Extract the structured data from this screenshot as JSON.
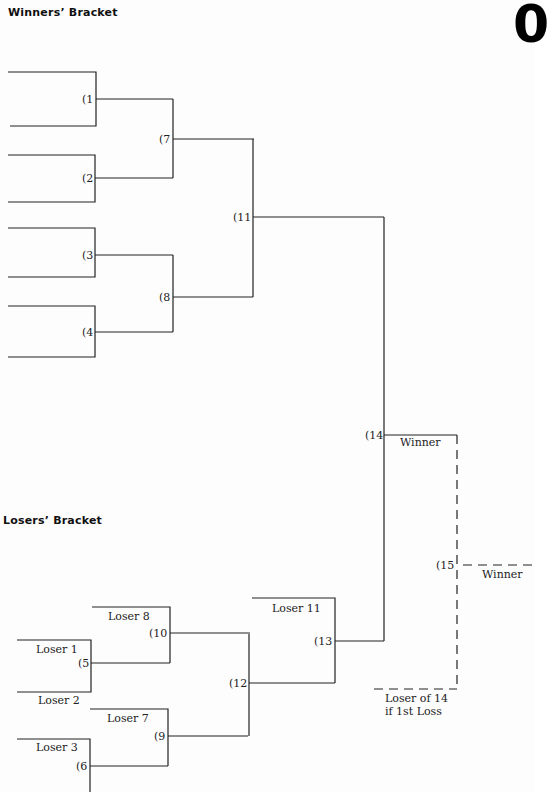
{
  "headings": {
    "winners": "Winners’ Bracket",
    "losers": "Losers’ Bracket",
    "corner_mark": "0"
  },
  "winners_bracket": {
    "games": {
      "g1": "(1",
      "g2": "(2",
      "g3": "(3",
      "g4": "(4",
      "g7": "(7",
      "g8": "(8",
      "g11": "(11",
      "g14": "(14"
    },
    "winner_label": "Winner"
  },
  "losers_bracket": {
    "games": {
      "g5": "(5",
      "g6": "(6",
      "g9": "(9",
      "g10": "(10",
      "g12": "(12",
      "g13": "(13"
    },
    "entries": {
      "loser1": "Loser 1",
      "loser2": "Loser 2",
      "loser3": "Loser 3",
      "loser7": "Loser 7",
      "loser8": "Loser 8",
      "loser11": "Loser 11"
    }
  },
  "final": {
    "game15": "(15",
    "winner_label": "Winner",
    "loser_of_14_line1": "Loser of 14",
    "loser_of_14_line2": "if 1st Loss"
  }
}
